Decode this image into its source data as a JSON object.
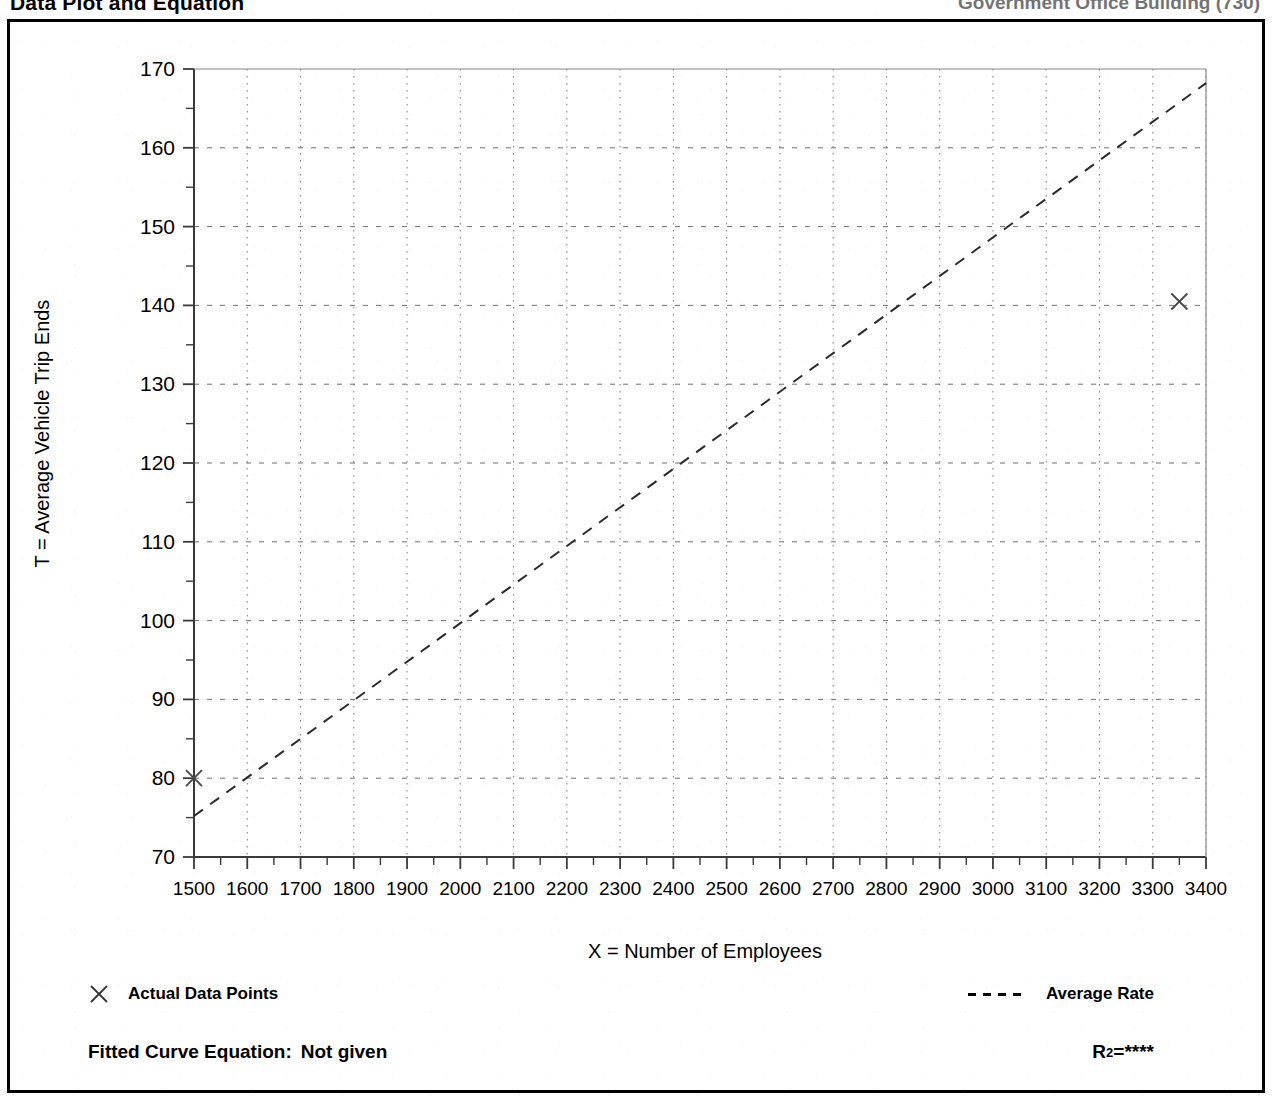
{
  "page": {
    "header_left": "Data Plot and Equation",
    "header_right": "Government Office Building (730)"
  },
  "figure": {
    "ylabel": "T = Average Vehicle Trip Ends",
    "xlabel": "X = Number of Employees"
  },
  "legend": {
    "data_points_marker": "x-marker-icon",
    "data_points_label": "Actual Data Points",
    "average_rate_marker": "dashed-line-icon",
    "average_rate_label": "Average Rate"
  },
  "footer": {
    "equation_label": "Fitted Curve Equation:",
    "equation_value": "Not given",
    "r2_label": "R",
    "r2_exponent": "2",
    "r2_equals": " = ",
    "r2_value": "****"
  },
  "chart_data": {
    "type": "scatter",
    "title": "Data Plot and Equation",
    "xlabel": "X = Number of Employees",
    "ylabel": "T = Average Vehicle Trip Ends",
    "xlim": [
      1500,
      3400
    ],
    "ylim": [
      70,
      170
    ],
    "xticks": [
      1500,
      1600,
      1700,
      1800,
      1900,
      2000,
      2100,
      2200,
      2300,
      2400,
      2500,
      2600,
      2700,
      2800,
      2900,
      3000,
      3100,
      3200,
      3300,
      3400
    ],
    "yticks": [
      70,
      80,
      90,
      100,
      110,
      120,
      130,
      140,
      150,
      160,
      170
    ],
    "y_minor_ticks": [
      75,
      85,
      95,
      105,
      115,
      125,
      135,
      145,
      155,
      165
    ],
    "x_minor_tick_step": 50,
    "grid": true,
    "grid_style": "dotted",
    "legend_position": "below-plot",
    "series": [
      {
        "name": "Actual Data Points",
        "type": "scatter",
        "marker": "x",
        "points": [
          {
            "x": 1500,
            "y": 80.0
          },
          {
            "x": 3350,
            "y": 140.5
          }
        ]
      },
      {
        "name": "Average Rate",
        "type": "line",
        "style": "dashed",
        "points": [
          {
            "x": 1500,
            "y": 75.2
          },
          {
            "x": 3400,
            "y": 168.2
          }
        ],
        "note": "Average rate line through origin; slope approximately 0.049 trips per employee"
      }
    ]
  }
}
